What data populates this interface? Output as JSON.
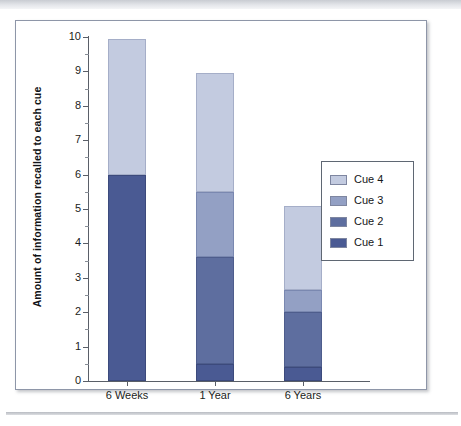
{
  "figure": {
    "caption": ""
  },
  "chart_data": {
    "type": "bar",
    "subtype": "stacked-bar",
    "title": "",
    "xlabel": "",
    "ylabel": "Amount of information recalled to each cue",
    "ylim": [
      0,
      10
    ],
    "ytick_labels": [
      "0",
      "1",
      "2",
      "3",
      "4",
      "5",
      "6",
      "7",
      "8",
      "9",
      "10"
    ],
    "ytick_values": [
      0,
      1,
      2,
      3,
      4,
      5,
      6,
      7,
      8,
      9,
      10
    ],
    "minor_ticks": true,
    "grid": false,
    "legend_position": "right",
    "categories": [
      "6 Weeks",
      "1 Year",
      "6 Years"
    ],
    "series": [
      {
        "name": "Cue 1",
        "color": "#4a5a93",
        "values": [
          6.0,
          0.5,
          0.4
        ]
      },
      {
        "name": "Cue 2",
        "color": "#5e6e9f",
        "values": [
          0.0,
          3.1,
          1.6
        ]
      },
      {
        "name": "Cue 3",
        "color": "#93a0c4",
        "values": [
          0.0,
          1.9,
          0.65
        ]
      },
      {
        "name": "Cue 4",
        "color": "#c3cbe0",
        "values": [
          3.95,
          3.45,
          2.45
        ]
      }
    ],
    "totals": [
      9.95,
      8.95,
      5.1
    ],
    "legend_order": [
      "Cue 4",
      "Cue 3",
      "Cue 2",
      "Cue 1"
    ]
  }
}
